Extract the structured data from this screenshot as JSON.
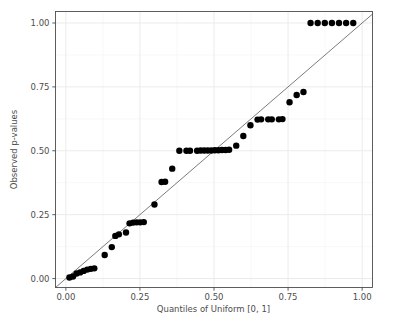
{
  "chart_data": {
    "type": "scatter",
    "title": "",
    "xlabel": "Quantiles of Uniform [0, 1]",
    "ylabel": "Observed p-values",
    "xlim": [
      -0.035,
      1.035
    ],
    "ylim": [
      -0.035,
      1.045
    ],
    "xticks": [
      0.0,
      0.25,
      0.5,
      0.75,
      1.0
    ],
    "xtick_labels": [
      "0.00",
      "0.25",
      "0.50",
      "0.75",
      "1.00"
    ],
    "yticks": [
      0.0,
      0.25,
      0.5,
      0.75,
      1.0
    ],
    "ytick_labels": [
      "0.00",
      "0.25",
      "0.50",
      "0.75",
      "1.00"
    ],
    "grid": true,
    "grid_major_color": "#ebebeb",
    "grid_minor_color": "#f5f5f5",
    "panel_background": "#ffffff",
    "panel_border_color": "#4d4d4d",
    "point_color": "#000000",
    "point_size": 5.2,
    "reference_line": {
      "type": "abline",
      "slope": 1,
      "intercept": 0,
      "color": "#595959",
      "width": 0.8
    },
    "x": [
      0.012,
      0.024,
      0.036,
      0.048,
      0.06,
      0.072,
      0.084,
      0.096,
      0.131,
      0.155,
      0.167,
      0.179,
      0.203,
      0.215,
      0.227,
      0.239,
      0.251,
      0.263,
      0.299,
      0.323,
      0.335,
      0.359,
      0.383,
      0.407,
      0.419,
      0.443,
      0.455,
      0.467,
      0.479,
      0.491,
      0.503,
      0.515,
      0.527,
      0.539,
      0.551,
      0.575,
      0.599,
      0.623,
      0.647,
      0.659,
      0.683,
      0.695,
      0.719,
      0.731,
      0.755,
      0.779,
      0.802,
      0.826,
      0.85,
      0.874,
      0.898,
      0.922,
      0.946,
      0.97
    ],
    "y": [
      0.004,
      0.008,
      0.02,
      0.024,
      0.03,
      0.035,
      0.038,
      0.04,
      0.092,
      0.123,
      0.167,
      0.173,
      0.18,
      0.216,
      0.219,
      0.22,
      0.22,
      0.221,
      0.29,
      0.378,
      0.379,
      0.43,
      0.5,
      0.5,
      0.5,
      0.5,
      0.501,
      0.501,
      0.501,
      0.501,
      0.502,
      0.502,
      0.503,
      0.503,
      0.504,
      0.52,
      0.558,
      0.6,
      0.622,
      0.623,
      0.623,
      0.623,
      0.623,
      0.624,
      0.69,
      0.718,
      0.73,
      1.0,
      1.0,
      1.0,
      1.0,
      1.0,
      1.0,
      1.0
    ]
  },
  "axes": {
    "x_title": "Quantiles of Uniform [0, 1]",
    "y_title": "Observed p-values"
  }
}
